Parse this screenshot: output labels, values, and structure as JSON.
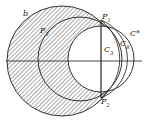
{
  "figure": {
    "labels": {
      "b": "b",
      "p1": "P",
      "p1_sub": "1",
      "p2": "P",
      "p2_sub": "2",
      "p3": "P",
      "p3_sub": "3",
      "c_star": "C*",
      "c3": "C",
      "c3_sub": "3",
      "c8": "C",
      "c8_sub": "8"
    },
    "colors": {
      "stroke": "#333333",
      "hatch": "#555555",
      "background": "#ffffff"
    }
  }
}
